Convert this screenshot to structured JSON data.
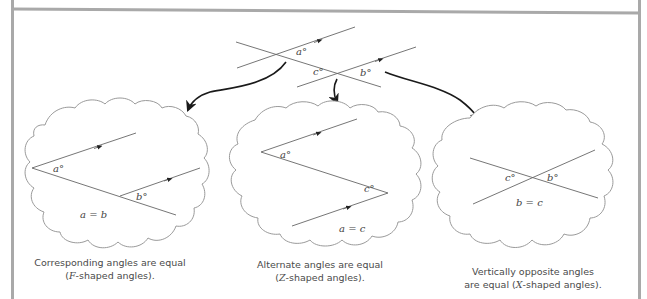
{
  "top_diagram": {
    "labels": {
      "a": "a°",
      "b": "b°",
      "c": "c°"
    }
  },
  "panels": [
    {
      "id": "corresponding",
      "labels": {
        "a": "a°",
        "b": "b°"
      },
      "equation": "a = b",
      "caption_line1": "Corresponding angles are equal",
      "caption_line2_letter": "F",
      "caption_line2_rest": "-shaped angles).",
      "caption_line2_open": "("
    },
    {
      "id": "alternate",
      "labels": {
        "a": "a°",
        "c": "c°"
      },
      "equation": "a = c",
      "caption_line1": "Alternate angles are equal",
      "caption_line2_letter": "Z",
      "caption_line2_rest": "-shaped angles).",
      "caption_line2_open": "("
    },
    {
      "id": "vertically-opposite",
      "labels": {
        "b": "b°",
        "c": "c°"
      },
      "equation": "b = c",
      "caption_line1": "Vertically opposite angles",
      "caption_line2_prefix": "are equal (",
      "caption_line2_letter": "X",
      "caption_line2_rest": "-shaped angles)."
    }
  ],
  "colors": {
    "line": "#555555",
    "cloud": "#9a9a9a",
    "arrow": "#1a1a1a",
    "frame": "#a9a9a9"
  }
}
